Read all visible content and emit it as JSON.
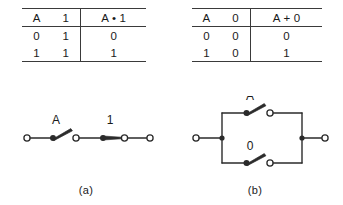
{
  "figure": {
    "type": "boolean-algebra-switching-circuits",
    "stroke_color": "#2b2b2b",
    "text_color": "#1a1a1a",
    "background": "#ffffff"
  },
  "tables": [
    {
      "id": "table-a",
      "headers": [
        "A",
        "1",
        "A • 1"
      ],
      "rows": [
        [
          "0",
          "1",
          "0"
        ],
        [
          "1",
          "1",
          "1"
        ]
      ]
    },
    {
      "id": "table-b",
      "headers": [
        "A",
        "0",
        "A + 0"
      ],
      "rows": [
        [
          "0",
          "0",
          "0"
        ],
        [
          "1",
          "0",
          "1"
        ]
      ]
    }
  ],
  "circuits": [
    {
      "id": "circuit-a",
      "topology": "series",
      "switches": [
        {
          "label": "A",
          "state": "open"
        },
        {
          "label": "1",
          "state": "closed"
        }
      ]
    },
    {
      "id": "circuit-b",
      "topology": "parallel",
      "switches": [
        {
          "label": "A",
          "state": "open"
        },
        {
          "label": "0",
          "state": "open"
        }
      ]
    }
  ],
  "captions": {
    "a": "(a)",
    "b": "(b)"
  }
}
